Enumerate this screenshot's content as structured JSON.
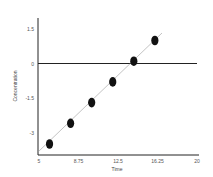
{
  "chart_data": {
    "type": "scatter",
    "title": "",
    "xlabel": "Time",
    "ylabel": "Concentration",
    "xlim": [
      5,
      20
    ],
    "ylim": [
      -3.75,
      2.25
    ],
    "x_ticks": [
      5,
      8.75,
      12.5,
      16.25,
      20
    ],
    "x_tick_labels": [
      "5",
      "8.75",
      "12.5",
      "16.25",
      "20"
    ],
    "y_ticks": [
      1.5,
      0,
      -1.5,
      -3
    ],
    "y_tick_labels": [
      "1.5",
      "0",
      "-1.5",
      "-3"
    ],
    "grid": false,
    "legend": null,
    "zero_line": true,
    "series": [
      {
        "name": "data",
        "x": [
          6,
          8,
          10,
          12,
          14,
          16
        ],
        "y": [
          -3.5,
          -2.6,
          -1.7,
          -0.8,
          0.1,
          1.0
        ],
        "marker": "filled-ellipse",
        "color": "#111111"
      }
    ],
    "fit_line": {
      "x": [
        5,
        16.8
      ],
      "y": [
        -3.85,
        1.3
      ],
      "color": "#999999"
    }
  },
  "colors": {
    "axis": "#222222",
    "marker": "#111111",
    "fit": "#9a9a9a"
  }
}
